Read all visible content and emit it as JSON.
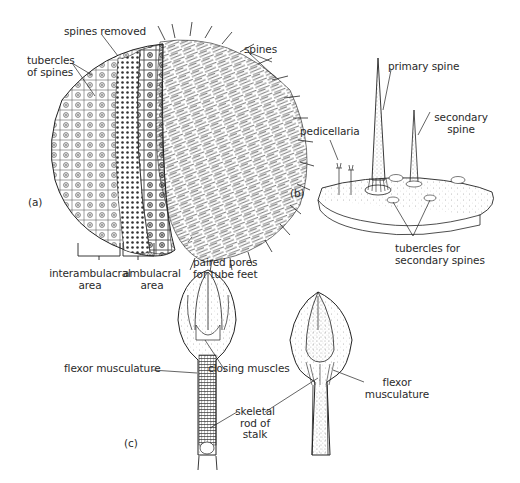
{
  "figure": {
    "panels": [
      {
        "id": "a",
        "panel_label": "(a)",
        "labels": {
          "spines_removed": "spines removed",
          "tubercles_of_spines": "tubercles\nof spines",
          "spines": "spines",
          "interambulacral_area": "interambulacral\narea",
          "ambulacral_area": "ambulacral\narea",
          "paired_pores": "paired pores\nfor tube feet"
        }
      },
      {
        "id": "b",
        "panel_label": "(b)",
        "labels": {
          "primary_spine": "primary spine",
          "secondary_spine": "secondary\nspine",
          "pedicellaria": "pedicellaria",
          "tubercles_secondary": "tubercles for\nsecondary spines"
        }
      },
      {
        "id": "c",
        "panel_label": "(c)",
        "labels": {
          "flexor_musculature_left": "flexor musculature",
          "closing_muscles": "closing muscles",
          "skeletal_rod": "skeletal\nrod of\nstalk",
          "flexor_musculature_right": "flexor\nmusculature"
        }
      }
    ]
  },
  "colors": {
    "ink": "#2a2a2a",
    "background": "#ffffff",
    "shade": "#8a8a8a"
  }
}
